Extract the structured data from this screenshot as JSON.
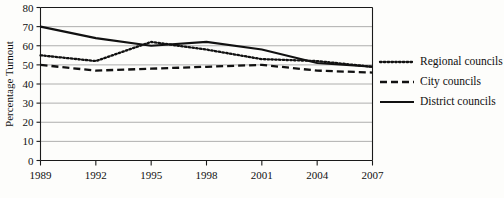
{
  "chart_data": {
    "type": "line",
    "title": "",
    "xlabel": "",
    "ylabel": "Percentage Turnout",
    "x": [
      1989,
      1992,
      1995,
      1998,
      2001,
      2004,
      2007
    ],
    "xticklabels": [
      "1989",
      "1992",
      "1995",
      "1998",
      "2001",
      "2004",
      "2007"
    ],
    "yticks": [
      0,
      10,
      20,
      30,
      40,
      50,
      60,
      70,
      80
    ],
    "yticklabels": [
      "0",
      "10",
      "20",
      "30",
      "40",
      "50",
      "60",
      "70",
      "80"
    ],
    "ylim": [
      0,
      80
    ],
    "xlim": [
      1989,
      2007
    ],
    "grid": true,
    "grid_axis": "y",
    "legend_position": "right",
    "series": [
      {
        "name": "Regional councils",
        "style": "dotted",
        "color": "#111111",
        "values": [
          55,
          52,
          62,
          58,
          53,
          52,
          49
        ]
      },
      {
        "name": "City councils",
        "style": "dashed",
        "color": "#111111",
        "values": [
          50,
          47,
          48,
          49,
          50,
          47,
          46
        ]
      },
      {
        "name": "District councils",
        "style": "solid",
        "color": "#111111",
        "values": [
          70,
          64,
          60,
          62,
          58,
          51,
          49
        ]
      }
    ]
  },
  "legend": {
    "items": [
      {
        "label": "Regional councils",
        "style": "dotted"
      },
      {
        "label": "City councils",
        "style": "dashed"
      },
      {
        "label": "District councils",
        "style": "solid"
      }
    ]
  },
  "colors": {
    "ink": "#111111",
    "grid": "#9a9a9a",
    "background": "#fdfdfb"
  }
}
